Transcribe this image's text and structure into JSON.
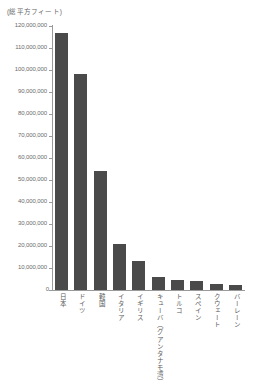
{
  "chart_data": {
    "type": "bar",
    "title": "",
    "unit_caption": "(総平方フィート)",
    "xlabel": "",
    "ylabel": "",
    "ylim": [
      0,
      120000000
    ],
    "grid": false,
    "legend": "none",
    "bar_color": "#4a4a4a",
    "axis_color": "#9a9a9a",
    "categories": [
      "日本",
      "ドイツ",
      "韓国",
      "イタリア",
      "イギリス",
      "キューバ（グアンタナモ湾）",
      "トルコ",
      "スペイン",
      "クウェート",
      "バーレーン"
    ],
    "values": [
      117000000,
      98000000,
      54000000,
      21000000,
      13000000,
      6000000,
      4500000,
      4200000,
      2800000,
      2400000
    ],
    "ytick_labels": [
      "120,000,000",
      "110,000,000",
      "100,000,000",
      "90,000,000",
      "80,000,000",
      "70,000,000",
      "60,000,000",
      "50,000,000",
      "40,000,000",
      "30,000,000",
      "20,000,000",
      "10,000,000",
      "0"
    ],
    "ytick_values": [
      120000000,
      110000000,
      100000000,
      90000000,
      80000000,
      70000000,
      60000000,
      50000000,
      40000000,
      30000000,
      20000000,
      10000000,
      0
    ]
  }
}
